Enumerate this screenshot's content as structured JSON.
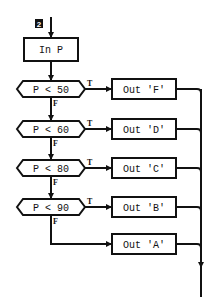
{
  "diagram": {
    "type": "flowchart",
    "step_badge": "2",
    "input_box": {
      "label": "In P"
    },
    "decisions": [
      {
        "label": "P < 50",
        "true_label": "T",
        "false_label": "F",
        "output": "Out 'F'"
      },
      {
        "label": "P < 60",
        "true_label": "T",
        "false_label": "F",
        "output": "Out 'D'"
      },
      {
        "label": "P < 80",
        "true_label": "T",
        "false_label": "F",
        "output": "Out 'C'"
      },
      {
        "label": "P < 90",
        "true_label": "T",
        "false_label": "F",
        "output": "Out 'B'"
      }
    ],
    "default_output": {
      "label": "Out 'A'"
    },
    "colors": {
      "stroke": "#111111",
      "background": "#ffffff",
      "badge": "#111111"
    }
  }
}
